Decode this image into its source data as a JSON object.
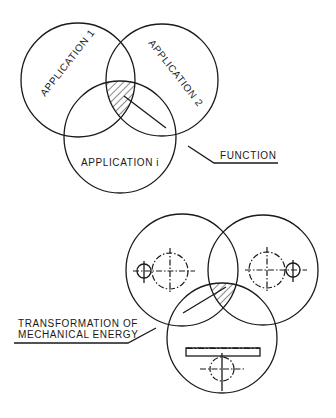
{
  "top_diagram": {
    "labels": {
      "app1": "APPLICATION 1",
      "app2": "APPLICATION 2",
      "appi": "APPLICATION i",
      "function": "FUNCTION"
    }
  },
  "bottom_diagram": {
    "labels": {
      "line1": "TRANSFORMATION OF",
      "line2": "MECHANICAL ENERGY"
    }
  },
  "colors": {
    "ink": "#1a1a1a",
    "background": "#ffffff"
  }
}
